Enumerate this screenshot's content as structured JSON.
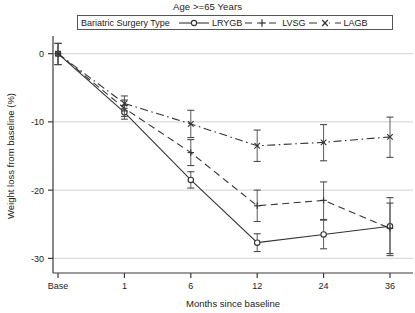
{
  "chart_data": {
    "type": "line",
    "title": "Age >=65 Years",
    "xlabel": "Months since baseline",
    "ylabel": "Weight loss from baseline (%)",
    "categories": [
      "Base",
      "1",
      "6",
      "12",
      "24",
      "36"
    ],
    "xticklabels": [
      "Base",
      "1",
      "6",
      "12",
      "24",
      "36"
    ],
    "yticklabels": [
      "0",
      "-10",
      "-20",
      "-30"
    ],
    "yticks": [
      0,
      -10,
      -20,
      -30
    ],
    "ylim": [
      -32,
      2
    ],
    "grid": "horizontal",
    "legend_position": "top",
    "legend_title": "Bariatric Surgery Type",
    "error_bars": "95% CI",
    "series": [
      {
        "name": "LRYGB",
        "marker": "circle",
        "linestyle": "solid",
        "values": [
          0,
          -8.6,
          -18.5,
          -27.7,
          -26.5,
          -25.3
        ],
        "err_low": [
          -1.6,
          -9.6,
          -19.7,
          -29.0,
          -28.6,
          -29.6
        ],
        "err_high": [
          1.5,
          -7.6,
          -17.3,
          -26.4,
          -24.4,
          -21.1
        ]
      },
      {
        "name": "LVSG",
        "marker": "plus",
        "linestyle": "dashed",
        "values": [
          0,
          -8.0,
          -14.5,
          -22.3,
          -21.5,
          -25.6
        ],
        "err_low": [
          -1.6,
          -9.2,
          -16.4,
          -24.6,
          -24.3,
          -29.3
        ],
        "err_high": [
          1.5,
          -6.8,
          -12.6,
          -20.0,
          -18.8,
          -21.9
        ]
      },
      {
        "name": "LAGB",
        "marker": "cross",
        "linestyle": "dashdot",
        "values": [
          0,
          -7.3,
          -10.3,
          -13.5,
          -13.0,
          -12.2
        ],
        "err_low": [
          -1.6,
          -8.4,
          -12.3,
          -15.8,
          -15.7,
          -15.2
        ],
        "err_high": [
          1.5,
          -6.2,
          -8.3,
          -11.2,
          -10.4,
          -9.3
        ]
      }
    ]
  },
  "legend": {
    "title": "Bariatric Surgery Type",
    "entries": [
      {
        "label": "LRYGB"
      },
      {
        "label": "LVSG"
      },
      {
        "label": "LAGB"
      }
    ]
  },
  "axes": {
    "x_title": "Months since baseline",
    "y_title": "Weight loss from baseline (%)"
  }
}
